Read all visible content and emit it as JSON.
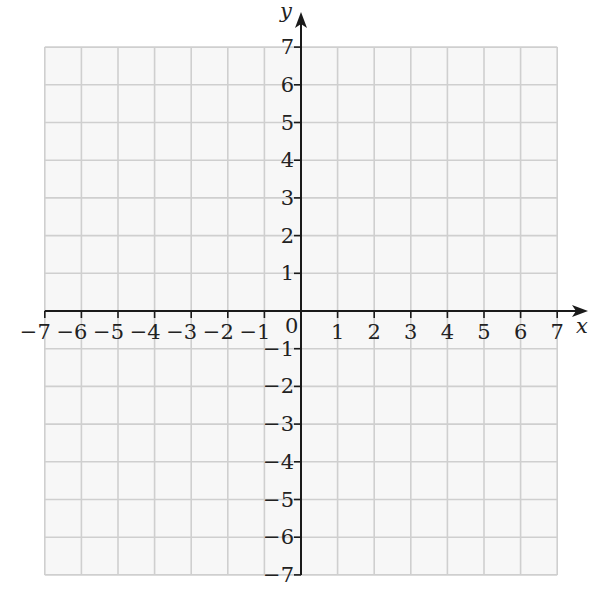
{
  "chart_data": {
    "type": "scatter",
    "title": "",
    "xlabel": "x",
    "ylabel": "y",
    "xlim": [
      -7,
      7
    ],
    "ylim": [
      -7,
      7
    ],
    "grid": true,
    "legend": null,
    "x_ticks": [
      -7,
      -6,
      -5,
      -4,
      -3,
      -2,
      -1,
      1,
      2,
      3,
      4,
      5,
      6,
      7
    ],
    "y_ticks": [
      -7,
      -6,
      -5,
      -4,
      -3,
      -2,
      -1,
      1,
      2,
      3,
      4,
      5,
      6,
      7
    ],
    "x_tick_labels": [
      "−7",
      "−6",
      "−5",
      "−4",
      "−3",
      "−2",
      "−1",
      "1",
      "2",
      "3",
      "4",
      "5",
      "6",
      "7"
    ],
    "y_tick_labels": [
      "−7",
      "−6",
      "−5",
      "−4",
      "−3",
      "−2",
      "−1",
      "1",
      "2",
      "3",
      "4",
      "5",
      "6",
      "7"
    ],
    "origin_label": "0",
    "series": []
  },
  "colors": {
    "grid": "#cfcfcf",
    "grid_fill": "#f7f7f7",
    "axis": "#1a1a1a",
    "text": "#222222"
  }
}
